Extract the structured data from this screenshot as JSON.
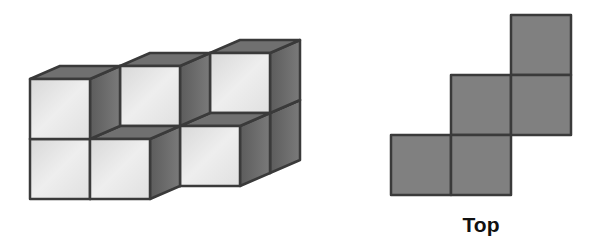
{
  "figure": {
    "isometric_view": {
      "cube_size": 60,
      "depth_offset": [
        30,
        -13
      ],
      "origin": [
        30,
        139
      ],
      "cubes": [
        {
          "col": 0,
          "depth": 0,
          "level": 0
        },
        {
          "col": 0,
          "depth": 0,
          "level": 1
        },
        {
          "col": 1,
          "depth": 0,
          "level": 0
        },
        {
          "col": 1,
          "depth": 1,
          "level": 0
        },
        {
          "col": 1,
          "depth": 1,
          "level": 1
        },
        {
          "col": 2,
          "depth": 1,
          "level": 0
        },
        {
          "col": 2,
          "depth": 2,
          "level": 0
        },
        {
          "col": 2,
          "depth": 2,
          "level": 1
        }
      ]
    },
    "top_view": {
      "label": "Top",
      "cell_size": 60,
      "origin": [
        391,
        15
      ],
      "cells": [
        {
          "col": 2,
          "row": 0
        },
        {
          "col": 1,
          "row": 1
        },
        {
          "col": 2,
          "row": 1
        },
        {
          "col": 0,
          "row": 2
        },
        {
          "col": 1,
          "row": 2
        }
      ]
    },
    "colors": {
      "front_face": "#e4e4e4",
      "top_face": "#707070",
      "side_face": "#6a6a6a",
      "top_view_fill": "#808080",
      "edge": "#3a3a3a"
    }
  }
}
